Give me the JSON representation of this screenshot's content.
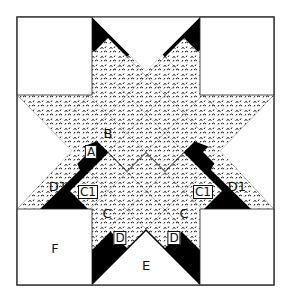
{
  "diagram": {
    "colors": {
      "dark": "#000000",
      "light": "#ffffff",
      "print": "#ffffff",
      "print_motif": "#111111",
      "outline": "#333333"
    },
    "labels": [
      {
        "id": "A",
        "text": "A",
        "x": 91,
        "y": 152,
        "boxed": true
      },
      {
        "id": "B",
        "text": "B",
        "x": 108,
        "y": 133,
        "boxed": false
      },
      {
        "id": "C1-left",
        "text": "C1",
        "x": 88,
        "y": 192,
        "boxed": true
      },
      {
        "id": "C1-right",
        "text": "C1",
        "x": 203,
        "y": 192,
        "boxed": true
      },
      {
        "id": "C-left",
        "text": "C",
        "x": 107,
        "y": 213,
        "boxed": false
      },
      {
        "id": "C-right",
        "text": "C",
        "x": 184,
        "y": 213,
        "boxed": false
      },
      {
        "id": "D1-left",
        "text": "D1",
        "x": 58,
        "y": 186,
        "boxed": false
      },
      {
        "id": "D1-right",
        "text": "D1",
        "x": 237,
        "y": 186,
        "boxed": false
      },
      {
        "id": "D-left",
        "text": "D",
        "x": 120,
        "y": 238,
        "boxed": true
      },
      {
        "id": "D-right",
        "text": "D",
        "x": 174,
        "y": 238,
        "boxed": true
      },
      {
        "id": "E",
        "text": "E",
        "x": 146,
        "y": 265,
        "boxed": false
      },
      {
        "id": "F",
        "text": "F",
        "x": 55,
        "y": 248,
        "boxed": false
      }
    ]
  }
}
